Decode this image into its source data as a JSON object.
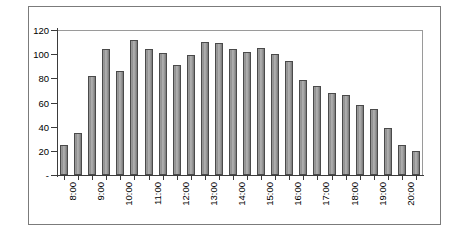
{
  "chart_data": {
    "type": "bar",
    "title": "",
    "subtitle": "",
    "xlabel": "",
    "ylabel": "",
    "ylim": [
      0,
      120
    ],
    "ytick_values": [
      0,
      20,
      40,
      60,
      80,
      100,
      120
    ],
    "ytick_labels": [
      "-",
      "20",
      "40",
      "60",
      "80",
      "100",
      "120"
    ],
    "grid": false,
    "legend": "none",
    "bar_color": "#9a9a9a",
    "bar_edge_color": "#4a4a4a",
    "frame_color": "#7b7b7b",
    "axis_color": "#3b3b3b",
    "x_interval_minutes": 30,
    "categories": [
      "8:00",
      "8:30",
      "9:00",
      "9:30",
      "10:00",
      "10:30",
      "11:00",
      "11:30",
      "12:00",
      "12:30",
      "13:00",
      "13:30",
      "14:00",
      "14:30",
      "15:00",
      "15:30",
      "16:00",
      "16:30",
      "17:00",
      "17:30",
      "18:00",
      "18:30",
      "19:00",
      "19:30",
      "20:00",
      "20:30"
    ],
    "xtick_labels": [
      "8:00",
      "",
      "9:00",
      "",
      "10:00",
      "",
      "11:00",
      "",
      "12:00",
      "",
      "13:00",
      "",
      "14:00",
      "",
      "15:00",
      "",
      "16:00",
      "",
      "17:00",
      "",
      "18:00",
      "",
      "19:00",
      "",
      "20:00",
      ""
    ],
    "values": [
      25,
      35,
      82,
      104,
      86,
      112,
      104,
      101,
      91,
      99,
      110,
      109,
      104,
      102,
      105,
      100,
      94,
      79,
      74,
      68,
      66,
      58,
      55,
      39,
      25,
      20
    ]
  }
}
